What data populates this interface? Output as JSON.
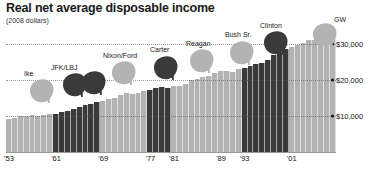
{
  "header": {
    "title": "Real net average disposable income",
    "subtitle": "(2008 dollars)"
  },
  "colors": {
    "republican": "#b3b3b3",
    "democrat": "#3a3a3a",
    "gridline": "#555555",
    "text": "#111111",
    "background": "#ffffff"
  },
  "chart_data": {
    "type": "bar",
    "title": "Real net average disposable income",
    "subtitle": "(2008 dollars)",
    "xlabel": "",
    "ylabel": "",
    "ylim": [
      0,
      34000
    ],
    "grid": true,
    "legend_position": "none",
    "y_ticks": [
      10000,
      20000,
      30000
    ],
    "y_tick_labels": [
      "$10,000",
      "$20,000",
      "$30,000"
    ],
    "x_tick_labels": [
      "'53",
      "'61",
      "'69",
      "'77",
      "'81",
      "'89",
      "'93",
      "'01"
    ],
    "x_tick_years": [
      1953,
      1961,
      1969,
      1977,
      1981,
      1989,
      1993,
      2001
    ],
    "categories": [
      1953,
      1954,
      1955,
      1956,
      1957,
      1958,
      1959,
      1960,
      1961,
      1962,
      1963,
      1964,
      1965,
      1966,
      1967,
      1968,
      1969,
      1970,
      1971,
      1972,
      1973,
      1974,
      1975,
      1976,
      1977,
      1978,
      1979,
      1980,
      1981,
      1982,
      1983,
      1984,
      1985,
      1986,
      1987,
      1988,
      1989,
      1990,
      1991,
      1992,
      1993,
      1994,
      1995,
      1996,
      1997,
      1998,
      1999,
      2000,
      2001,
      2002,
      2003,
      2004,
      2005,
      2006,
      2007,
      2008
    ],
    "values": [
      9300,
      9500,
      9900,
      10100,
      10200,
      10100,
      10400,
      10500,
      10700,
      11100,
      11400,
      12000,
      12600,
      13000,
      13400,
      13900,
      14300,
      14700,
      15100,
      15800,
      16500,
      16300,
      16500,
      16900,
      17300,
      17900,
      18100,
      17900,
      18300,
      18400,
      18900,
      20000,
      20400,
      21000,
      21200,
      21900,
      22500,
      22600,
      22400,
      23200,
      23300,
      23900,
      24400,
      24900,
      25700,
      26900,
      27600,
      28700,
      29200,
      29800,
      30500,
      31100,
      31200,
      32000,
      32600,
      31400
    ],
    "party_by_bar": [
      "rep",
      "rep",
      "rep",
      "rep",
      "rep",
      "rep",
      "rep",
      "rep",
      "dem",
      "dem",
      "dem",
      "dem",
      "dem",
      "dem",
      "dem",
      "dem",
      "rep",
      "rep",
      "rep",
      "rep",
      "rep",
      "rep",
      "rep",
      "rep",
      "dem",
      "dem",
      "dem",
      "dem",
      "rep",
      "rep",
      "rep",
      "rep",
      "rep",
      "rep",
      "rep",
      "rep",
      "rep",
      "rep",
      "rep",
      "rep",
      "dem",
      "dem",
      "dem",
      "dem",
      "dem",
      "dem",
      "dem",
      "dem",
      "rep",
      "rep",
      "rep",
      "rep",
      "rep",
      "rep",
      "rep",
      "rep"
    ],
    "series": [
      {
        "name": "Real net average disposable income",
        "values": [
          9300,
          9500,
          9900,
          10100,
          10200,
          10100,
          10400,
          10500,
          10700,
          11100,
          11400,
          12000,
          12600,
          13000,
          13400,
          13900,
          14300,
          14700,
          15100,
          15800,
          16500,
          16300,
          16500,
          16900,
          17300,
          17900,
          18100,
          17900,
          18300,
          18400,
          18900,
          20000,
          20400,
          21000,
          21200,
          21900,
          22500,
          22600,
          22400,
          23200,
          23300,
          23900,
          24400,
          24900,
          25700,
          26900,
          27600,
          28700,
          29200,
          29800,
          30500,
          31100,
          31200,
          32000,
          32600,
          31400
        ]
      }
    ],
    "annotations": [
      {
        "label": "Ike",
        "party": "rep",
        "start_year": 1953,
        "end_year": 1960
      },
      {
        "label": "JFK/LBJ",
        "party": "dem",
        "start_year": 1961,
        "end_year": 1968
      },
      {
        "label": "Nixon/Ford",
        "party": "rep",
        "start_year": 1969,
        "end_year": 1976
      },
      {
        "label": "Carter",
        "party": "dem",
        "start_year": 1977,
        "end_year": 1980
      },
      {
        "label": "Reagan",
        "party": "rep",
        "start_year": 1981,
        "end_year": 1988
      },
      {
        "label": "Bush Sr.",
        "party": "rep",
        "start_year": 1989,
        "end_year": 1992
      },
      {
        "label": "Clinton",
        "party": "dem",
        "start_year": 1993,
        "end_year": 2000
      },
      {
        "label": "GW",
        "party": "rep",
        "start_year": 2001,
        "end_year": 2008
      }
    ]
  },
  "presidents": [
    {
      "label": "Ike",
      "party": "rep",
      "x": 28,
      "y": 78,
      "label_x": 24,
      "label_y": 70
    },
    {
      "label": "JFK/LBJ",
      "party": "dem",
      "x": 61,
      "y": 72,
      "label_x": 51,
      "label_y": 64
    },
    {
      "label": "Nixon/Ford",
      "party": "rep",
      "x": 110,
      "y": 60,
      "label_x": 103,
      "label_y": 52
    },
    {
      "label": "Carter",
      "party": "dem",
      "x": 152,
      "y": 55,
      "label_x": 150,
      "label_y": 46
    },
    {
      "label": "Reagan",
      "party": "rep",
      "x": 188,
      "y": 48,
      "label_x": 186,
      "label_y": 40
    },
    {
      "label": "Bush Sr.",
      "party": "rep",
      "x": 228,
      "y": 40,
      "label_x": 225,
      "label_y": 31
    },
    {
      "label": "Clinton",
      "party": "dem",
      "x": 262,
      "y": 30,
      "label_x": 260,
      "label_y": 22
    },
    {
      "label": "GW",
      "party": "rep",
      "x": 311,
      "y": 22,
      "label_x": 334,
      "label_y": 16
    }
  ],
  "extra_heads": [
    {
      "label": "",
      "party": "dem",
      "x": 80,
      "y": 70
    }
  ]
}
